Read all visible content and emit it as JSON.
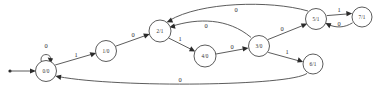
{
  "diagram": {
    "type": "state-transition-diagram",
    "colors": {
      "background": "#ffffff",
      "stroke": "#4a4a4a",
      "text": "#2b2b2b"
    },
    "start_marker": {
      "name": "initial-state-arrow",
      "target": "0/0"
    },
    "nodes": [
      {
        "id": "n0",
        "label": "0/0",
        "cx": 46,
        "cy": 71,
        "r": 10.5
      },
      {
        "id": "n1",
        "label": "1/0",
        "cx": 106,
        "cy": 51,
        "r": 10.5
      },
      {
        "id": "n2",
        "label": "2/1",
        "cx": 160,
        "cy": 31,
        "r": 11.0
      },
      {
        "id": "n4",
        "label": "4/0",
        "cx": 205,
        "cy": 56,
        "r": 11.0
      },
      {
        "id": "n3",
        "label": "3/0",
        "cx": 259,
        "cy": 46,
        "r": 10.5
      },
      {
        "id": "n5",
        "label": "5/1",
        "cx": 316,
        "cy": 19,
        "r": 10.5
      },
      {
        "id": "n7",
        "label": "7/1",
        "cx": 362,
        "cy": 17,
        "r": 10.0
      },
      {
        "id": "n6",
        "label": "6/1",
        "cx": 313,
        "cy": 64,
        "r": 10.0
      }
    ],
    "edges": [
      {
        "name": "edge-0-self",
        "from": "0/0",
        "to": "0/0",
        "label": "0",
        "lx": 46,
        "ly": 48
      },
      {
        "name": "edge-0-to-1",
        "from": "0/0",
        "to": "1/0",
        "label": "1",
        "lx": 76,
        "ly": 54
      },
      {
        "name": "edge-1-to-2",
        "from": "1/0",
        "to": "2/1",
        "label": "0",
        "lx": 133,
        "ly": 34
      },
      {
        "name": "edge-2-to-4",
        "from": "2/1",
        "to": "4/0",
        "label": "1",
        "lx": 179,
        "ly": 39
      },
      {
        "name": "edge-4-to-3",
        "from": "4/0",
        "to": "3/0",
        "label": "0",
        "lx": 233,
        "ly": 46
      },
      {
        "name": "edge-3-to-2",
        "from": "3/0",
        "to": "2/1",
        "label": "0",
        "lx": 205,
        "ly": 25
      },
      {
        "name": "edge-3-to-5",
        "from": "3/0",
        "to": "5/1",
        "label": "0",
        "lx": 281,
        "ly": 28
      },
      {
        "name": "edge-3-to-6",
        "from": "3/0",
        "to": "6/1",
        "label": "1",
        "lx": 286,
        "ly": 52
      },
      {
        "name": "edge-5-to-2",
        "from": "5/1",
        "to": "2/1",
        "label": "0",
        "lx": 235,
        "ly": 10
      },
      {
        "name": "edge-5-to-7",
        "from": "5/1",
        "to": "7/1",
        "label": "1",
        "lx": 339,
        "ly": 11
      },
      {
        "name": "edge-7-to-5",
        "from": "7/1",
        "to": "5/1",
        "label": "0",
        "lx": 339,
        "ly": 24
      },
      {
        "name": "edge-6-to-0",
        "from": "6/1",
        "to": "0/0",
        "label": "0",
        "lx": 180,
        "ly": 80
      }
    ]
  }
}
